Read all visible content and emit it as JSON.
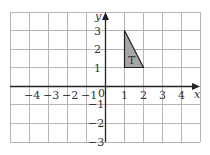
{
  "diagram": {
    "type": "coordinate-grid",
    "axes": {
      "x_label": "x",
      "y_label": "y",
      "origin_label": "0",
      "x_range": [
        -5,
        5
      ],
      "y_range": [
        -3,
        4
      ]
    },
    "x_ticks": [
      {
        "value": -4,
        "label": "−4"
      },
      {
        "value": -3,
        "label": "−3"
      },
      {
        "value": -2,
        "label": "−2"
      },
      {
        "value": -1,
        "label": "−1"
      },
      {
        "value": 1,
        "label": "1"
      },
      {
        "value": 2,
        "label": "2"
      },
      {
        "value": 3,
        "label": "3"
      },
      {
        "value": 4,
        "label": "4"
      }
    ],
    "y_ticks": [
      {
        "value": 3,
        "label": "3"
      },
      {
        "value": 2,
        "label": "2"
      },
      {
        "value": 1,
        "label": "1"
      },
      {
        "value": -1,
        "label": "−1"
      },
      {
        "value": -2,
        "label": "−2"
      },
      {
        "value": -3,
        "label": "−3"
      }
    ],
    "shape": {
      "name": "T",
      "label": "T",
      "vertices": [
        [
          1,
          3
        ],
        [
          1,
          1
        ],
        [
          2,
          1
        ]
      ],
      "fill": "#a6a6a6",
      "stroke": "#222222"
    },
    "colors": {
      "grid": "#b5b5b5",
      "axis": "#222222"
    }
  }
}
